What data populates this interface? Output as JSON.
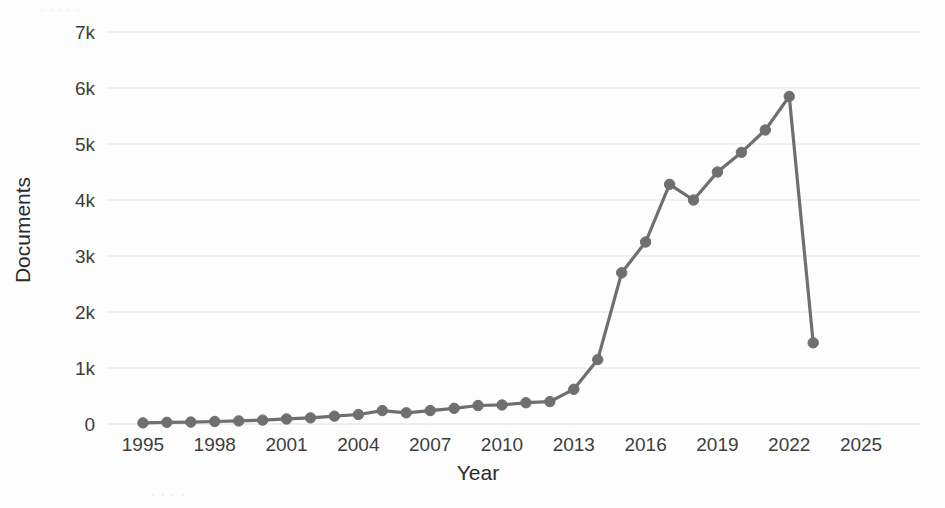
{
  "chart_data": {
    "type": "line",
    "title": "",
    "subtitle": "",
    "xlabel": "Year",
    "ylabel": "Documents",
    "xlim": [
      1994,
      2026
    ],
    "ylim": [
      0,
      7000
    ],
    "grid": true,
    "legend": null,
    "legend_position": "none",
    "line_color": "#6f6f6f",
    "marker_color": "#6f6f6f",
    "marker": "circle",
    "gridline_color": "#e6e6e8",
    "background_color": "#fdfdfd",
    "xticks": [
      1995,
      1998,
      2001,
      2004,
      2007,
      2010,
      2013,
      2016,
      2019,
      2022,
      2025
    ],
    "xtick_labels": [
      "1995",
      "1998",
      "2001",
      "2004",
      "2007",
      "2010",
      "2013",
      "2016",
      "2019",
      "2022",
      "2025"
    ],
    "yticks": [
      0,
      1000,
      2000,
      3000,
      4000,
      5000,
      6000,
      7000
    ],
    "ytick_labels": [
      "0",
      "1k",
      "2k",
      "3k",
      "4k",
      "5k",
      "6k",
      "7k"
    ],
    "x": [
      1995,
      1996,
      1997,
      1998,
      1999,
      2000,
      2001,
      2002,
      2003,
      2004,
      2005,
      2006,
      2007,
      2008,
      2009,
      2010,
      2011,
      2012,
      2013,
      2014,
      2015,
      2016,
      2017,
      2018,
      2019,
      2020,
      2021,
      2022,
      2023
    ],
    "values": [
      20,
      30,
      35,
      45,
      55,
      70,
      90,
      110,
      140,
      170,
      240,
      200,
      240,
      280,
      330,
      340,
      380,
      400,
      620,
      1150,
      2700,
      3250,
      4280,
      4000,
      4500,
      4850,
      5250,
      5850,
      1450
    ],
    "series": [
      {
        "name": "Documents",
        "values": [
          20,
          30,
          35,
          45,
          55,
          70,
          90,
          110,
          140,
          170,
          240,
          200,
          240,
          280,
          330,
          340,
          380,
          400,
          620,
          1150,
          2700,
          3250,
          4280,
          4000,
          4500,
          4850,
          5250,
          5850,
          1450
        ]
      }
    ],
    "annotations": []
  },
  "bleed_text": {
    "line1": "· · · · ·",
    "line2": "· · · ·"
  }
}
